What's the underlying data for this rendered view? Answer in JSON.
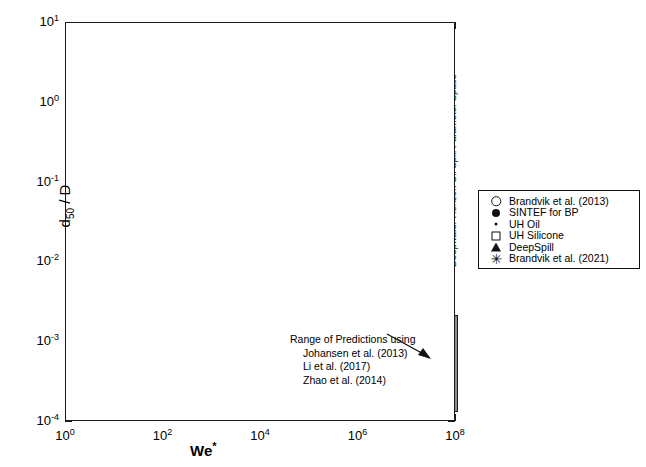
{
  "chart_data": {
    "type": "scatter",
    "title": "",
    "xlabel": "We*",
    "ylabel": "d50 / D",
    "xscale": "log",
    "yscale": "log",
    "xlim": [
      1,
      100000000
    ],
    "ylim": [
      0.0001,
      10
    ],
    "grid": false,
    "xticklabels": [
      "10^0",
      "10^2",
      "10^4",
      "10^6",
      "10^8"
    ],
    "xtickvalues": [
      1,
      100,
      10000,
      1000000,
      100000000
    ],
    "yticklabels": [
      "10^1",
      "10^0",
      "10^-1",
      "10^-2",
      "10^-3",
      "10^-4"
    ],
    "ytickvalues": [
      10,
      1,
      0.1,
      0.01,
      0.001,
      0.0001
    ],
    "legend_position": "outside-right",
    "series": [
      {
        "name": "Brandvik et al. (2013)",
        "marker": "open-circle",
        "points": [
          [
            3500,
            0.115
          ],
          [
            4800,
            0.09
          ],
          [
            6200,
            0.072
          ],
          [
            7000,
            0.062
          ],
          [
            9000,
            0.052
          ],
          [
            11000,
            0.046
          ],
          [
            13000,
            0.04
          ],
          [
            16000,
            0.036
          ],
          [
            2100,
            0.15
          ],
          [
            2600,
            0.135
          ],
          [
            5200,
            0.081
          ],
          [
            8200,
            0.057
          ],
          [
            1500,
            0.175
          ],
          [
            1900,
            0.16
          ],
          [
            20000,
            0.033
          ],
          [
            25000,
            0.03
          ]
        ]
      },
      {
        "name": "SINTEF for BP",
        "marker": "filled-circle",
        "points": [
          [
            900,
            0.215
          ],
          [
            1100,
            0.2
          ],
          [
            1400,
            0.19
          ],
          [
            1800,
            0.175
          ],
          [
            2300,
            0.16
          ],
          [
            2900,
            0.15
          ],
          [
            3600,
            0.14
          ],
          [
            4200,
            0.13
          ],
          [
            5000,
            0.125
          ],
          [
            6000,
            0.115
          ],
          [
            7200,
            0.105
          ],
          [
            8500,
            0.098
          ],
          [
            10000,
            0.092
          ],
          [
            12000,
            0.085
          ],
          [
            14000,
            0.078
          ],
          [
            17000,
            0.07
          ],
          [
            1250,
            0.185
          ],
          [
            2000,
            0.168
          ],
          [
            3100,
            0.145
          ],
          [
            4600,
            0.128
          ],
          [
            6800,
            0.11
          ],
          [
            9200,
            0.095
          ],
          [
            11500,
            0.088
          ],
          [
            15000,
            0.074
          ],
          [
            2500,
            0.155
          ],
          [
            5600,
            0.12
          ],
          [
            13500,
            0.08
          ],
          [
            19000,
            0.062
          ],
          [
            22000,
            0.058
          ],
          [
            8000,
            0.102
          ],
          [
            3300,
            0.142
          ],
          [
            1600,
            0.18
          ]
        ]
      },
      {
        "name": "UH Oil",
        "marker": "dot",
        "points": [
          [
            15,
            0.33
          ],
          [
            20,
            0.33
          ],
          [
            55,
            0.33
          ],
          [
            70,
            0.33
          ],
          [
            180,
            0.33
          ],
          [
            230,
            0.33
          ],
          [
            270,
            0.33
          ],
          [
            310,
            0.33
          ],
          [
            360,
            0.325
          ],
          [
            420,
            0.32
          ],
          [
            480,
            0.315
          ],
          [
            540,
            0.31
          ],
          [
            600,
            0.305
          ],
          [
            680,
            0.3
          ],
          [
            760,
            0.295
          ],
          [
            850,
            0.29
          ],
          [
            260,
            0.34
          ],
          [
            330,
            0.335
          ],
          [
            450,
            0.3
          ],
          [
            620,
            0.285
          ]
        ]
      },
      {
        "name": "UH Silicone",
        "marker": "open-square",
        "points": [
          [
            190,
            1.0
          ],
          [
            240,
            1.05
          ],
          [
            300,
            0.98
          ],
          [
            370,
            0.92
          ],
          [
            215,
            0.88
          ],
          [
            280,
            0.86
          ],
          [
            340,
            1.0
          ],
          [
            200,
            0.42
          ],
          [
            250,
            0.4
          ],
          [
            310,
            0.38
          ],
          [
            380,
            0.36
          ],
          [
            230,
            0.35
          ],
          [
            290,
            0.33
          ],
          [
            350,
            0.345
          ],
          [
            560,
            0.165
          ],
          [
            900,
            0.135
          ],
          [
            1300,
            0.11
          ]
        ]
      },
      {
        "name": "DeepSpill",
        "marker": "triangle",
        "points": [
          [
            21000,
            0.03
          ],
          [
            24000,
            0.027
          ],
          [
            26000,
            0.0235
          ]
        ]
      },
      {
        "name": "Brandvik et al. (2021)",
        "marker": "star",
        "points": [
          [
            4000,
            0.125
          ],
          [
            6500,
            0.11
          ],
          [
            9500,
            0.1
          ],
          [
            12000,
            0.092
          ],
          [
            15000,
            0.085
          ],
          [
            18000,
            0.072
          ],
          [
            23000,
            0.06
          ],
          [
            30000,
            0.056
          ],
          [
            40000,
            0.05
          ],
          [
            55000,
            0.045
          ],
          [
            14000,
            0.098
          ],
          [
            11000,
            0.105
          ],
          [
            7500,
            0.118
          ],
          [
            20000,
            0.066
          ],
          [
            260000,
            0.0175
          ],
          [
            330000,
            0.0155
          ],
          [
            420000,
            0.015
          ],
          [
            520000,
            0.0128
          ],
          [
            700000,
            0.0115
          ],
          [
            950000,
            0.0105
          ],
          [
            1100000,
            0.0098
          ],
          [
            1500000,
            0.009
          ],
          [
            2000000,
            0.0092
          ],
          [
            2900000,
            0.0105
          ],
          [
            640000,
            0.0078
          ],
          [
            1000000,
            0.0074
          ],
          [
            1400000,
            0.0072
          ],
          [
            3600000,
            0.0097
          ]
        ]
      }
    ],
    "annotations": [
      {
        "name": "prediction-range",
        "lines": [
          "Range of Predictions using",
          "Johansen et al. (2013)",
          "Li et al. (2017)",
          "Zhao et al. (2014)"
        ],
        "target": "vertical gray bar at We* = 10^8"
      },
      {
        "name": "dwh-parameter-space",
        "text": "Deepwater Horizon Oil Spill Parameter Space"
      }
    ],
    "shaded_regions": [
      {
        "name": "dwh-band",
        "x_range": [
          30000000,
          100000000
        ],
        "y_range": [
          0.0001,
          10
        ],
        "color": "#e6e6e6"
      },
      {
        "name": "prediction-range-bar",
        "x_center": 100000000,
        "y_range": [
          0.00013,
          0.0021
        ],
        "color": "#8c8c8c"
      }
    ]
  },
  "axes": {
    "ylabel_main": "d",
    "ylabel_sub": "50",
    "ylabel_tail": " / D",
    "xlabel_main": "We",
    "xlabel_sup": "*"
  },
  "legend": {
    "entries": [
      {
        "label": "Brandvik et al. (2013)",
        "marker": "open-circle"
      },
      {
        "label": "SINTEF for BP",
        "marker": "filled-circle"
      },
      {
        "label": "UH Oil",
        "marker": "dot"
      },
      {
        "label": "UH Silicone",
        "marker": "open-square"
      },
      {
        "label": "DeepSpill",
        "marker": "triangle"
      },
      {
        "label": "Brandvik et al. (2021)",
        "marker": "star"
      }
    ]
  },
  "band": {
    "label": "Deepwater Horizon Oil Spill Parameter Space"
  },
  "annotation": {
    "line1": "Range of Predictions using",
    "line2": "Johansen et al. (2013)",
    "line3": "Li et al. (2017)",
    "line4": "Zhao et al. (2014)"
  }
}
